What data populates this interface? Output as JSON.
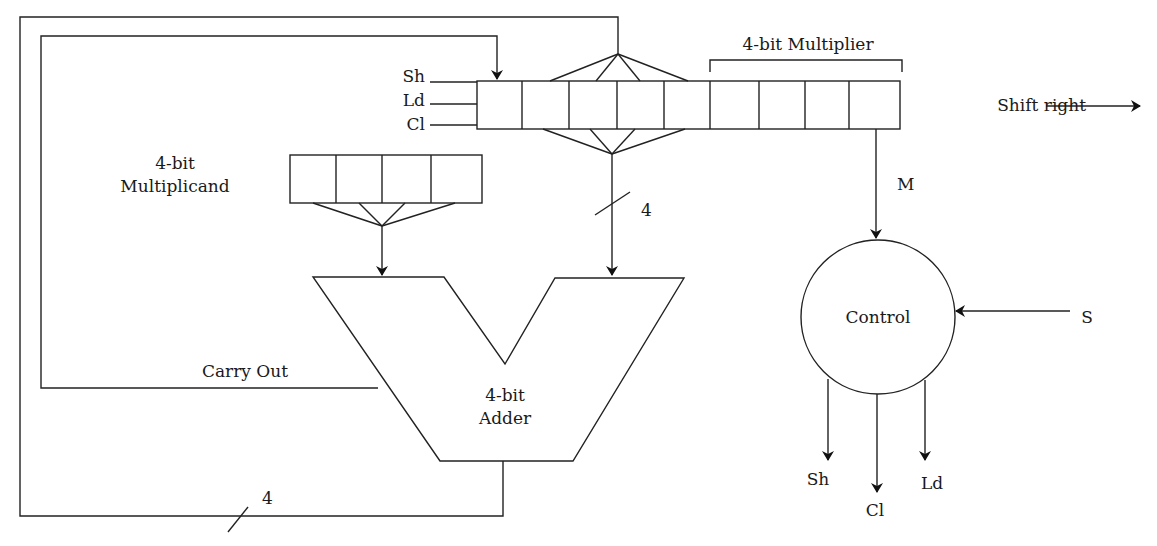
{
  "diagram": {
    "labels": {
      "multiplier": "4-bit Multiplier",
      "multiplicand_line1": "4-bit",
      "multiplicand_line2": "Multiplicand",
      "adder_line1": "4-bit",
      "adder_line2": "Adder",
      "control": "Control",
      "carry_out": "Carry Out",
      "shift_right": "Shift right",
      "m_signal": "M",
      "s_signal": "S",
      "bus_width_top": "4",
      "bus_width_bottom": "4",
      "input_sh": "Sh",
      "input_ld": "Ld",
      "input_cl": "Cl",
      "output_sh": "Sh",
      "output_cl": "Cl",
      "output_ld": "Ld"
    },
    "registers": {
      "product_register_cells": 9,
      "multiplier_cells": 4,
      "multiplicand_cells": 4
    }
  }
}
